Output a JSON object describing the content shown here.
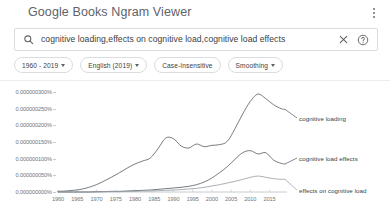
{
  "header": {
    "brand": "Google Books Ngram Viewer",
    "menu_icon": "kebab-menu-icon"
  },
  "search": {
    "icon": "search-icon",
    "value": "cognitive loading,effects on cognitive load,cognitive load effects",
    "placeholder": "Search in Google Books Ngram Viewer",
    "clear_icon": "close-icon",
    "help_icon": "help-circle-icon"
  },
  "filters": [
    {
      "label": "1960 - 2019",
      "has_caret": true
    },
    {
      "label": "English (2019)",
      "has_caret": true
    },
    {
      "label": "Case-Insensitive",
      "has_caret": false
    },
    {
      "label": "Smoothing",
      "has_caret": true
    }
  ],
  "chart_data": {
    "type": "line",
    "title": "",
    "xlabel": "",
    "ylabel": "",
    "grid": false,
    "legend_position": "inline-right",
    "xlim": [
      1960,
      2019
    ],
    "ylim": [
      0,
      3e-07
    ],
    "xticks": [
      1960,
      1965,
      1970,
      1975,
      1980,
      1985,
      1990,
      1995,
      2000,
      2005,
      2010,
      2015
    ],
    "yticks": [
      "0.000000000%",
      "0.000000050%",
      "0.000000100%",
      "0.000000150%",
      "0.000000200%",
      "0.000000250%",
      "0.000000300%"
    ],
    "ytick_values": [
      0,
      5e-11,
      1e-10,
      1.5e-10,
      2e-10,
      2.5e-10,
      3e-10
    ],
    "x": [
      1960,
      1962,
      1964,
      1966,
      1968,
      1970,
      1972,
      1974,
      1976,
      1978,
      1980,
      1982,
      1984,
      1986,
      1988,
      1990,
      1992,
      1994,
      1996,
      1998,
      2000,
      2002,
      2004,
      2006,
      2008,
      2010,
      2012,
      2014,
      2016,
      2018,
      2019
    ],
    "series": [
      {
        "name": "cognitive loading",
        "color": "#5f6368",
        "label_x": 2019,
        "values": [
          0.02,
          0.03,
          0.05,
          0.08,
          0.14,
          0.22,
          0.33,
          0.45,
          0.58,
          0.72,
          0.84,
          0.93,
          1.02,
          1.3,
          1.62,
          1.6,
          1.38,
          1.32,
          1.44,
          1.36,
          1.4,
          1.42,
          1.52,
          1.9,
          2.34,
          2.72,
          2.94,
          2.8,
          2.62,
          2.5,
          2.48
        ],
        "units": "1e-10 percent"
      },
      {
        "name": "cognitive load effects",
        "color": "#5f6368",
        "label_x": 2019,
        "values": [
          0.0,
          0.0,
          0.0,
          0.0,
          0.0,
          0.01,
          0.01,
          0.02,
          0.02,
          0.03,
          0.04,
          0.05,
          0.06,
          0.08,
          0.1,
          0.12,
          0.14,
          0.17,
          0.22,
          0.3,
          0.42,
          0.58,
          0.76,
          0.98,
          1.18,
          1.24,
          1.14,
          1.18,
          0.96,
          0.86,
          0.84
        ],
        "units": "1e-10 percent"
      },
      {
        "name": "effects on cognitive load",
        "color": "#9aa0a6",
        "label_x": 2019,
        "values": [
          0.0,
          0.0,
          0.0,
          0.0,
          0.0,
          0.0,
          0.01,
          0.01,
          0.01,
          0.02,
          0.02,
          0.03,
          0.03,
          0.04,
          0.05,
          0.06,
          0.07,
          0.09,
          0.11,
          0.14,
          0.18,
          0.22,
          0.27,
          0.32,
          0.38,
          0.44,
          0.48,
          0.44,
          0.4,
          0.38,
          0.38
        ],
        "units": "1e-10 percent"
      }
    ]
  }
}
